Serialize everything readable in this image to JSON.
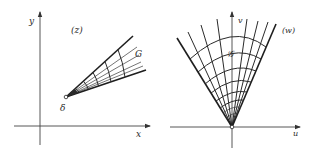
{
  "figure": {
    "left_panel": {
      "plane_label": "(z)",
      "x_axis_label": "x",
      "y_axis_label": "y",
      "region_label": "G",
      "vertex_label": "δ"
    },
    "right_panel": {
      "plane_label": "(w)",
      "u_axis_label": "u",
      "v_axis_label": "v",
      "region_label": "𝒢"
    },
    "colors": {
      "ink": "#222222",
      "background": "#ffffff"
    }
  }
}
